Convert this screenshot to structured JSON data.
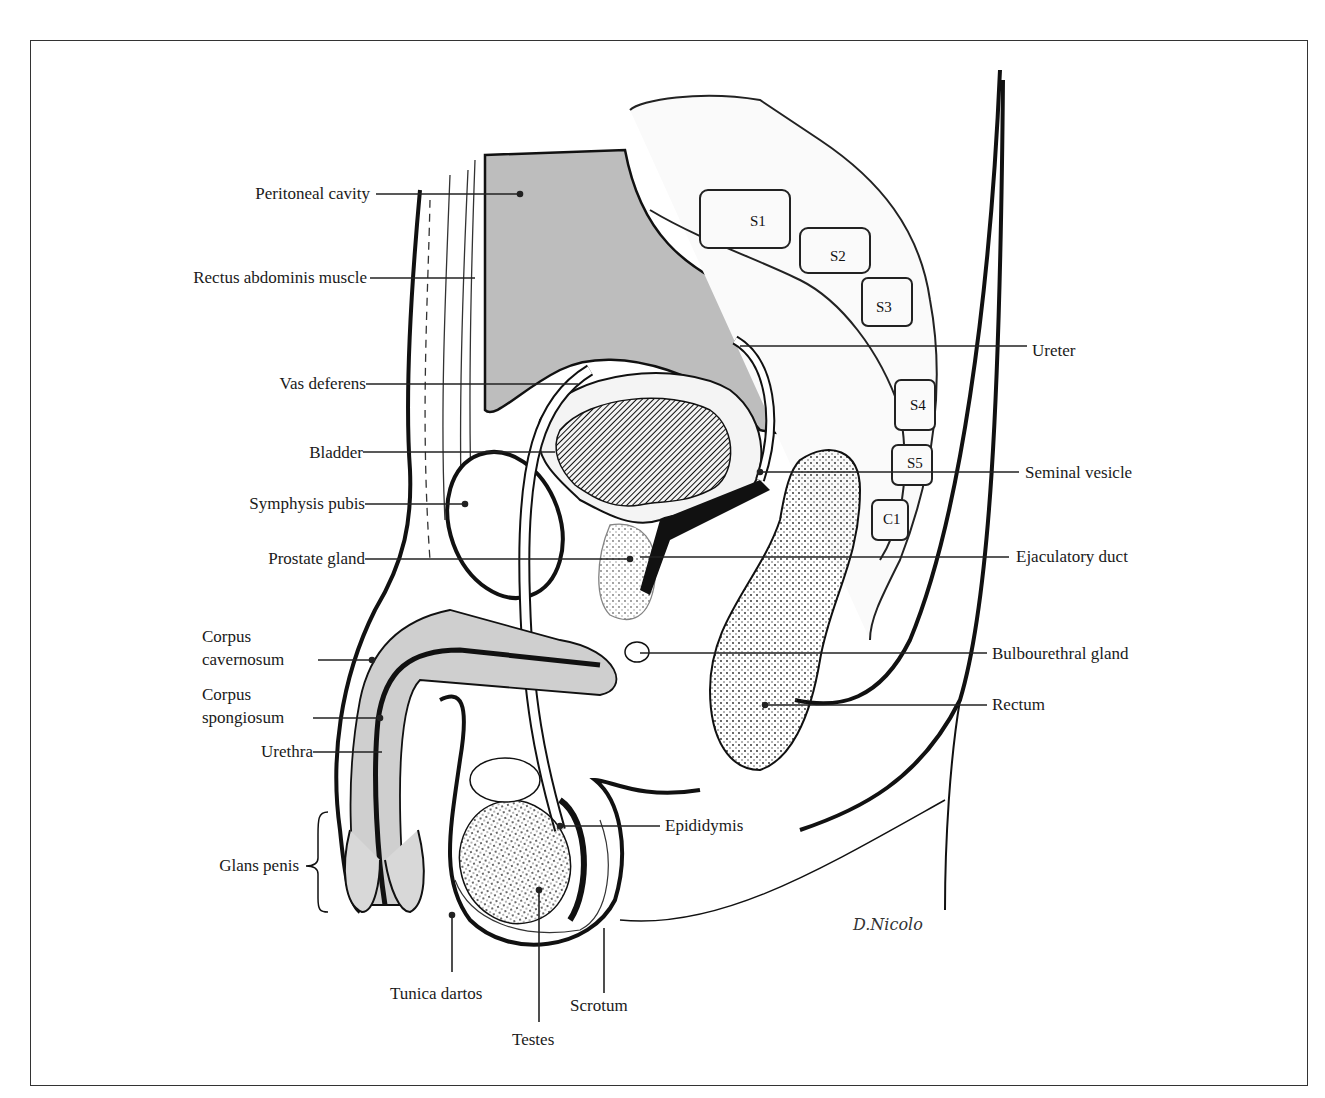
{
  "diagram": {
    "type": "anatomical-illustration",
    "signature": "D.Nicolo",
    "vertebrae": [
      "S1",
      "S2",
      "S3",
      "S4",
      "S5",
      "C1"
    ],
    "labels_left": [
      {
        "id": "peritoneal-cavity",
        "text": "Peritoneal cavity"
      },
      {
        "id": "rectus-abdominis",
        "text": "Rectus abdominis muscle"
      },
      {
        "id": "vas-deferens",
        "text": "Vas deferens"
      },
      {
        "id": "bladder",
        "text": "Bladder"
      },
      {
        "id": "symphysis-pubis",
        "text": "Symphysis pubis"
      },
      {
        "id": "prostate-gland",
        "text": "Prostate gland"
      },
      {
        "id": "corpus-cavernosum",
        "text": "Corpus cavernosum",
        "line1": "Corpus",
        "line2": "cavernosum"
      },
      {
        "id": "corpus-spongiosum",
        "text": "Corpus spongiosum",
        "line1": "Corpus",
        "line2": "spongiosum"
      },
      {
        "id": "urethra",
        "text": "Urethra"
      },
      {
        "id": "glans-penis",
        "text": "Glans penis"
      }
    ],
    "labels_right": [
      {
        "id": "ureter",
        "text": "Ureter"
      },
      {
        "id": "seminal-vesicle",
        "text": "Seminal vesicle"
      },
      {
        "id": "ejaculatory-duct",
        "text": "Ejaculatory duct"
      },
      {
        "id": "bulbourethral-gland",
        "text": "Bulbourethral gland"
      },
      {
        "id": "rectum",
        "text": "Rectum"
      },
      {
        "id": "epididymis",
        "text": "Epididymis"
      }
    ],
    "labels_bottom": [
      {
        "id": "tunica-dartos",
        "text": "Tunica dartos"
      },
      {
        "id": "scrotum",
        "text": "Scrotum"
      },
      {
        "id": "testes",
        "text": "Testes"
      }
    ]
  }
}
